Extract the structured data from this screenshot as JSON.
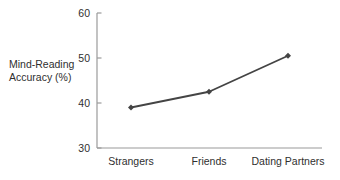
{
  "chart_data": {
    "type": "line",
    "title": "",
    "xlabel": "",
    "ylabel": "Mind-Reading\nAccuracy (%)",
    "categories": [
      "Strangers",
      "Friends",
      "Dating Partners"
    ],
    "values": [
      39,
      42.5,
      50.5
    ],
    "series": [
      {
        "name": "Mind-Reading Accuracy",
        "values": [
          39,
          42.5,
          50.5
        ]
      }
    ],
    "ylim": [
      30,
      60
    ],
    "yticks": [
      30,
      40,
      50,
      60
    ],
    "ytick_labels": [
      "30",
      "40",
      "50",
      "60"
    ],
    "grid": false,
    "legend": false,
    "legend_position": "none",
    "marker": "diamond",
    "line_color": "#444444",
    "axis_color": "#9a9a9a",
    "text_color": "#2f2f2f",
    "background_color": "#ffffff"
  }
}
